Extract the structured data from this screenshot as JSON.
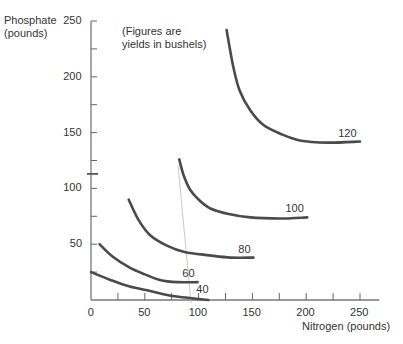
{
  "chart_data": {
    "type": "line",
    "title": "",
    "annotation": [
      "(Figures are",
      "yields in bushels)"
    ],
    "xlabel": "Nitrogen (pounds)",
    "ylabel": [
      "Phosphate",
      "(pounds)"
    ],
    "xlim": [
      0,
      250
    ],
    "ylim": [
      0,
      250
    ],
    "x_ticks": [
      0,
      50,
      100,
      150,
      200,
      250
    ],
    "y_ticks": [
      50,
      100,
      150,
      200,
      250
    ],
    "grid": false,
    "legend": "none (curves labeled inline)",
    "series": [
      {
        "name": "120",
        "label": "120",
        "points": [
          [
            126,
            242
          ],
          [
            132,
            210
          ],
          [
            138,
            188
          ],
          [
            148,
            170
          ],
          [
            160,
            157
          ],
          [
            176,
            149
          ],
          [
            194,
            143
          ],
          [
            220,
            141
          ],
          [
            250,
            142
          ]
        ]
      },
      {
        "name": "100",
        "label": "100",
        "points": [
          [
            82,
            126
          ],
          [
            86,
            112
          ],
          [
            92,
            99
          ],
          [
            100,
            90
          ],
          [
            111,
            82
          ],
          [
            128,
            77
          ],
          [
            148,
            74
          ],
          [
            175,
            73
          ],
          [
            201,
            74
          ]
        ]
      },
      {
        "name": "80",
        "label": "80",
        "points": [
          [
            35,
            90
          ],
          [
            44,
            72
          ],
          [
            55,
            58
          ],
          [
            70,
            49
          ],
          [
            87,
            43
          ],
          [
            110,
            40
          ],
          [
            130,
            38
          ],
          [
            151,
            38
          ]
        ]
      },
      {
        "name": "60",
        "label": "60",
        "points": [
          [
            8,
            50
          ],
          [
            20,
            39
          ],
          [
            36,
            29
          ],
          [
            50,
            23
          ],
          [
            64,
            18
          ],
          [
            80,
            16
          ],
          [
            99,
            16
          ]
        ]
      },
      {
        "name": "40",
        "label": "40",
        "points": [
          [
            0,
            25
          ],
          [
            18,
            18
          ],
          [
            36,
            12
          ],
          [
            55,
            8
          ],
          [
            73,
            4
          ],
          [
            90,
            2
          ],
          [
            109,
            0
          ]
        ]
      }
    ]
  }
}
